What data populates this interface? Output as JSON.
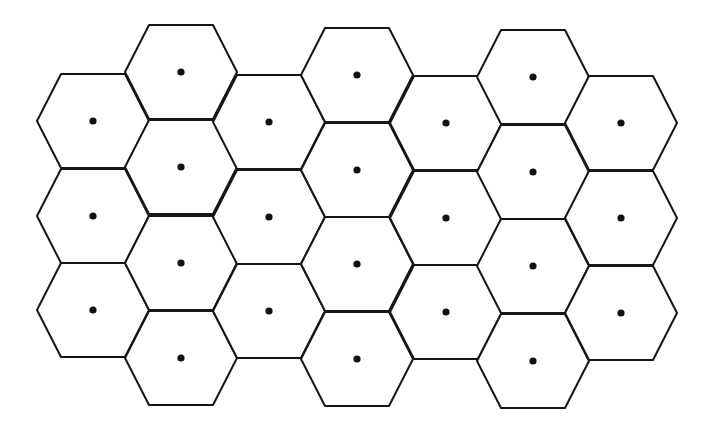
{
  "diagram": {
    "type": "hexagonal-cell-layout",
    "background": "#ffffff",
    "stroke_color": "#161616",
    "dot_color": "#111111",
    "hex_geometry": {
      "half_width": 56,
      "half_height": 47,
      "edge_half_length": 32,
      "dot_radius": 3.6
    },
    "columns": [
      {
        "x": 93,
        "cells": [
          121,
          216,
          310
        ]
      },
      {
        "x": 181,
        "cells": [
          72,
          167,
          263,
          358
        ]
      },
      {
        "x": 269,
        "cells": [
          122,
          217,
          311
        ]
      },
      {
        "x": 357,
        "cells": [
          75,
          170,
          264,
          359
        ]
      },
      {
        "x": 446,
        "cells": [
          123,
          218,
          312
        ]
      },
      {
        "x": 533,
        "cells": [
          77,
          172,
          266,
          361
        ]
      },
      {
        "x": 621,
        "cells": [
          123,
          218,
          313
        ]
      }
    ],
    "cell_count": 25
  }
}
